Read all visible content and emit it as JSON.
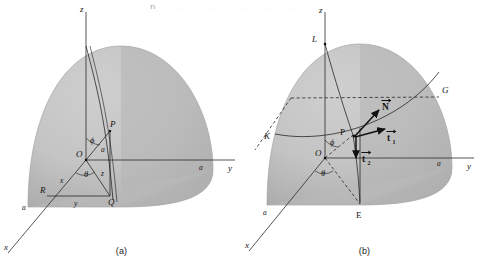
{
  "figure": {
    "top_cut_text": "p, ..., ... ... ... ... ... ... ... ... .... ... ... ...",
    "background_color": "#ffffff",
    "sphere_fill_light": "#c8c8c8",
    "sphere_fill_dark": "#b0b0b0",
    "line_color": "#1d1d1d",
    "panels": [
      {
        "id": "a",
        "caption": "(a)",
        "axes": [
          {
            "name": "z-axis",
            "label": "z"
          },
          {
            "name": "y-axis",
            "label": "y"
          },
          {
            "name": "x-axis",
            "label": "x"
          }
        ],
        "axis_marks": [
          {
            "name": "y-axis-radius-mark",
            "label": "a"
          },
          {
            "name": "x-axis-radius-mark",
            "label": "a"
          }
        ],
        "points": [
          {
            "name": "origin",
            "label": "O"
          },
          {
            "name": "point-p",
            "label": "P"
          },
          {
            "name": "point-q",
            "label": "Q"
          },
          {
            "name": "point-r",
            "label": "R"
          }
        ],
        "angles": [
          {
            "name": "angle-phi",
            "label": "ϕ"
          },
          {
            "name": "angle-theta",
            "label": "θ"
          }
        ],
        "segments": [
          {
            "name": "radius-op",
            "label": "a"
          },
          {
            "name": "height-z",
            "label": "z"
          },
          {
            "name": "component-x",
            "label": "x"
          },
          {
            "name": "component-y",
            "label": "y"
          }
        ]
      },
      {
        "id": "b",
        "caption": "(b)",
        "axes": [
          {
            "name": "z-axis",
            "label": "z"
          },
          {
            "name": "y-axis",
            "label": "y"
          },
          {
            "name": "x-axis",
            "label": "x"
          }
        ],
        "axis_marks": [
          {
            "name": "y-axis-radius-mark",
            "label": "a"
          },
          {
            "name": "x-axis-radius-mark",
            "label": "a"
          }
        ],
        "points": [
          {
            "name": "point-l",
            "label": "L"
          },
          {
            "name": "point-g",
            "label": "G"
          },
          {
            "name": "point-k",
            "label": "K"
          },
          {
            "name": "point-e",
            "label": "E"
          },
          {
            "name": "point-p",
            "label": "P"
          },
          {
            "name": "origin",
            "label": "O"
          }
        ],
        "angles": [
          {
            "name": "angle-phi",
            "label": "ϕ"
          },
          {
            "name": "angle-theta",
            "label": "θ"
          }
        ],
        "vectors": [
          {
            "name": "vector-normal",
            "label": "N",
            "accent": "→"
          },
          {
            "name": "vector-t1",
            "label": "t",
            "subscript": "1",
            "accent": "→"
          },
          {
            "name": "vector-t2",
            "label": "t",
            "subscript": "2",
            "accent": "→"
          }
        ]
      }
    ]
  }
}
